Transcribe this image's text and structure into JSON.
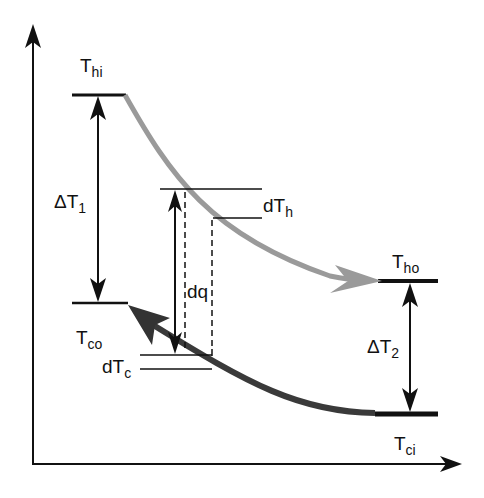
{
  "diagram": {
    "labels": {
      "t_hi": {
        "main": "T",
        "sub": "hi"
      },
      "t_ho": {
        "main": "T",
        "sub": "ho"
      },
      "t_co": {
        "main": "T",
        "sub": "co"
      },
      "t_ci": {
        "main": "T",
        "sub": "ci"
      },
      "delta_t1": {
        "main": "ΔT",
        "sub": "1"
      },
      "delta_t2": {
        "main": "ΔT",
        "sub": "2"
      },
      "dt_h": {
        "main": "dT",
        "sub": "h"
      },
      "dt_c": {
        "main": "dT",
        "sub": "c"
      },
      "dq": "dq"
    },
    "colors": {
      "hot_stream": "#9a9a9a",
      "cold_stream": "#3a3a3a",
      "lines": "#111111"
    }
  }
}
